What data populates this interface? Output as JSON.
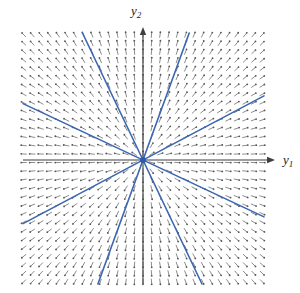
{
  "figure": {
    "axes": {
      "x_label_base": "y",
      "x_label_sub": "1",
      "y_label_base": "y",
      "y_label_sub": "2"
    }
  },
  "chart_data": {
    "type": "line",
    "title": "",
    "xlabel": "y1",
    "ylabel": "y2",
    "origin_screen": {
      "x": 143,
      "y": 160
    },
    "field_bounds_screen": {
      "left": 23,
      "top": 33,
      "right": 264,
      "bottom": 284
    },
    "axis_tips_screen": {
      "x_axis_tip_x": 275,
      "y_axis_tip_y": 27
    },
    "grid": {
      "start_x": 24,
      "start_y": 35,
      "spacing": 8.5,
      "cols": 29,
      "rows": 30,
      "dash_length": 5.6,
      "tip_radius": 0.9,
      "min_radius": 6
    },
    "trajectory_slopes": [
      0.53,
      -0.47,
      2.75,
      -2.1
    ],
    "line_width_trajectory": 1.6,
    "line_width_axis": 1.1,
    "line_width_dash": 1,
    "origin_dot_radius": 3,
    "colors": {
      "trajectory": "#3a66b2",
      "dash": "#8d8d8d",
      "dash_tip": "#565656",
      "axis": "#3f3f3f",
      "label": "#1a1a1a",
      "background": "#ffffff",
      "origin_dot": "#2f5aa8"
    },
    "legend": null,
    "grid_lines": "off",
    "tick_labels": "none"
  }
}
